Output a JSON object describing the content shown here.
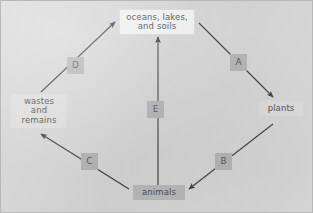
{
  "figure": {
    "background_color": "#d6d6d6",
    "border_color": "#b8b8b8",
    "line_color": "#3a3a3a",
    "label_box_color": "#b4b4b4",
    "text_color": "#4a4a4a"
  },
  "nodes": {
    "top": {
      "label": "oceans, lakes,\nand soils",
      "background": "#f4f4f4"
    },
    "left": {
      "label": "wastes\nand\nremains",
      "background": "#dedede"
    },
    "right": {
      "label": "plants",
      "background": "#dcdcdc"
    },
    "bottom": {
      "label": "animals",
      "background": "#b9b9b9"
    }
  },
  "arrow_labels": {
    "a": "A",
    "b": "B",
    "c": "C",
    "d": "D",
    "e": "E"
  },
  "diagram_data": {
    "type": "cycle-diagram",
    "nodes": [
      {
        "id": "top",
        "text": "oceans, lakes, and soils"
      },
      {
        "id": "right",
        "text": "plants"
      },
      {
        "id": "bottom",
        "text": "animals"
      },
      {
        "id": "left",
        "text": "wastes and remains"
      }
    ],
    "edges": [
      {
        "label": "A",
        "from": "top",
        "to": "right",
        "direction": "down-right"
      },
      {
        "label": "B",
        "from": "right",
        "to": "bottom",
        "direction": "down-left"
      },
      {
        "label": "C",
        "from": "bottom",
        "to": "left",
        "direction": "up-left"
      },
      {
        "label": "D",
        "from": "left",
        "to": "top",
        "direction": "up-right"
      },
      {
        "label": "E",
        "from": "bottom",
        "to": "top",
        "direction": "up"
      }
    ]
  }
}
